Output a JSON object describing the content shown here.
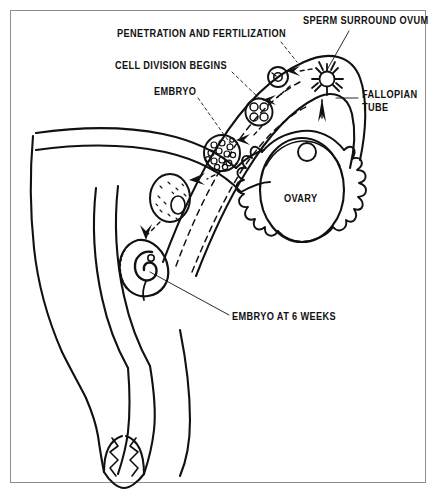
{
  "figure": {
    "kind": "medical-diagram",
    "background_color": "#ffffff",
    "ink_color": "#111111",
    "frame_color": "#8d8d8d"
  },
  "labels": {
    "penetration": "PENETRATION AND FERTILIZATION",
    "cell_division": "CELL DIVISION BEGINS",
    "embryo": "EMBRYO",
    "sperm_surround_ovum": "SPERM SURROUND OVUM",
    "fallopian_tube_line1": "FALLOPIAN",
    "fallopian_tube_line2": "TUBE",
    "ovary": "OVARY",
    "embryo_at_6_weeks": "EMBRYO AT 6 WEEKS"
  },
  "structures": [
    {
      "name": "uterus",
      "label_shown": false
    },
    {
      "name": "fallopian-tube",
      "label_shown": true
    },
    {
      "name": "ovary",
      "label_shown": true
    },
    {
      "name": "fimbriae",
      "label_shown": false
    },
    {
      "name": "cervix",
      "label_shown": false
    },
    {
      "name": "vaginal-canal",
      "label_shown": false
    }
  ],
  "stages": [
    {
      "name": "sperm-surround-ovum",
      "label_shown": true
    },
    {
      "name": "zygote-penetration-fertilization",
      "label_shown": true
    },
    {
      "name": "four-cell-cleavage",
      "label_shown": true
    },
    {
      "name": "morula",
      "label_shown": false
    },
    {
      "name": "blastocyst-embryo",
      "label_shown": true
    },
    {
      "name": "implanted-embryo-6-weeks",
      "label_shown": true
    }
  ]
}
